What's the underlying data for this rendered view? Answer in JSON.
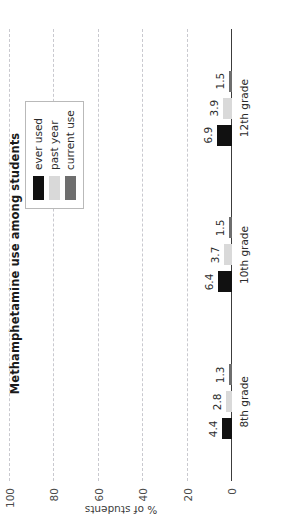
{
  "chart_data": {
    "type": "bar",
    "title": "Methamphetamine use among students",
    "xlabel": "",
    "ylabel": "% of students",
    "categories": [
      "8th grade",
      "10th grade",
      "12th grade"
    ],
    "series": [
      {
        "name": "ever used",
        "values": [
          4.4,
          6.4,
          6.9
        ],
        "color": "#111111"
      },
      {
        "name": "past year",
        "values": [
          2.8,
          3.7,
          3.9
        ],
        "color": "#d9d9d9"
      },
      {
        "name": "current use",
        "values": [
          1.3,
          1.5,
          1.5
        ],
        "color": "#6e6e6e"
      }
    ],
    "ylim": [
      0,
      100
    ],
    "yticks": [
      0,
      20,
      40,
      60,
      80,
      100
    ],
    "ytick_labels": [
      "0",
      "20",
      "40",
      "60",
      "80",
      "100"
    ],
    "grid": true,
    "grid_axis": "y",
    "legend_position": "upper right",
    "data_labels": true,
    "orientation": "vertical-rotated",
    "rotation_degrees": -90
  },
  "legend": {
    "items": [
      {
        "label": "ever used"
      },
      {
        "label": "past year"
      },
      {
        "label": "current use"
      }
    ]
  }
}
